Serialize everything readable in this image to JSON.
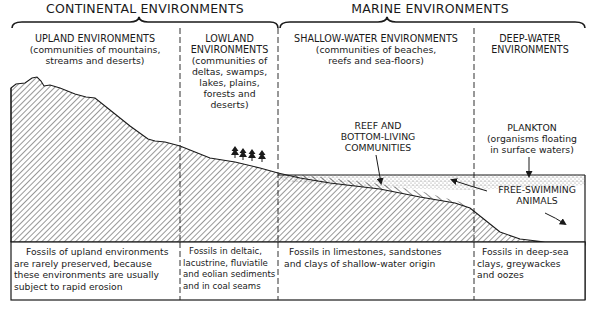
{
  "headers": {
    "continental": "CONTINENTAL ENVIRONMENTS",
    "marine": "MARINE ENVIRONMENTS"
  },
  "zones": [
    {
      "id": "upland",
      "title": "UPLAND ENVIRONMENTS",
      "description_lines": [
        "(communities of mountains,",
        "streams and deserts)"
      ],
      "fossil_lines": [
        "Fossils of upland environments",
        "are rarely preserved, because",
        "these environments are usually",
        "subject to rapid erosion"
      ]
    },
    {
      "id": "lowland",
      "title_lines": [
        "LOWLAND",
        "ENVIRONMENTS"
      ],
      "description_lines": [
        "(communities of",
        "deltas, swamps,",
        "lakes, plains,",
        "forests and",
        "deserts)"
      ],
      "fossil_lines": [
        "Fossils in deltaic,",
        "lacustrine, fluviatile",
        "and eolian sediments",
        "and in coal seams"
      ]
    },
    {
      "id": "shallow-water",
      "title": "SHALLOW-WATER ENVIRONMENTS",
      "description_lines": [
        "(communities of beaches,",
        "reefs and sea-floors)"
      ],
      "fossil_lines": [
        "Fossils in limestones, sandstones",
        "and clays of shallow-water origin"
      ]
    },
    {
      "id": "deep-water",
      "title_lines": [
        "DEEP-WATER",
        "ENVIRONMENTS"
      ],
      "fossil_lines": [
        "Fossils in deep-sea",
        "clays, greywackes",
        "and oozes"
      ]
    }
  ],
  "annotations": {
    "reef": [
      "REEF AND",
      "BOTTOM-LIVING",
      "COMMUNITIES"
    ],
    "plankton": [
      "PLANKTON",
      "(organisms floating",
      "in surface waters)"
    ],
    "free_swimming": [
      "FREE-SWIMMING",
      "ANIMALS"
    ]
  },
  "icons": {
    "trees": "tree-icon"
  },
  "colors": {
    "ink": "#1a1a1a",
    "background": "#ffffff",
    "stipple": "#8a8a8a"
  }
}
